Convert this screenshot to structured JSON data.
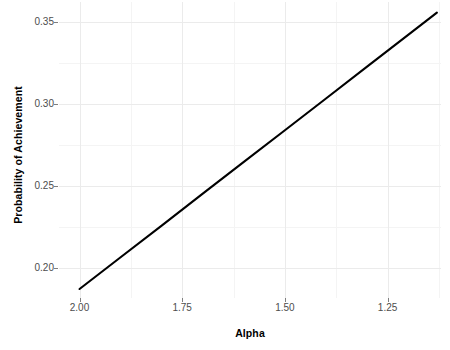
{
  "chart_data": {
    "type": "line",
    "title": "",
    "xlabel": "Alpha",
    "ylabel": "Probability of Achievement",
    "xlim": [
      2.05,
      1.12
    ],
    "ylim": [
      0.1815,
      0.3625
    ],
    "x_reversed": true,
    "grid": true,
    "legend": null,
    "x_ticks": [
      {
        "value": 2.0,
        "label": "2.00"
      },
      {
        "value": 1.75,
        "label": "1.75"
      },
      {
        "value": 1.5,
        "label": "1.50"
      },
      {
        "value": 1.25,
        "label": "1.25"
      }
    ],
    "x_minor_ticks": [
      2.125,
      1.875,
      1.625,
      1.375,
      1.125
    ],
    "y_ticks": [
      {
        "value": 0.35,
        "label": "0.35"
      },
      {
        "value": 0.3,
        "label": "0.30"
      },
      {
        "value": 0.25,
        "label": "0.25"
      },
      {
        "value": 0.2,
        "label": "0.20"
      }
    ],
    "y_minor_ticks": [
      0.225,
      0.275,
      0.325,
      0.175,
      0.375
    ],
    "series": [
      {
        "name": "probability-of-achievement",
        "color": "#000000",
        "line_width": 2.1,
        "x": [
          2.0,
          1.9,
          1.8,
          1.7,
          1.6,
          1.5,
          1.4,
          1.3,
          1.2,
          1.13
        ],
        "y": [
          0.187,
          0.2064,
          0.2258,
          0.2453,
          0.2647,
          0.2841,
          0.3035,
          0.323,
          0.3424,
          0.356
        ]
      }
    ],
    "panel_background": "#ffffff",
    "grid_major_color": "#ebebeb",
    "grid_minor_color": "#f4f4f4",
    "tick_label_color": "#4d4d4d",
    "axis_title_color": "#000000"
  }
}
